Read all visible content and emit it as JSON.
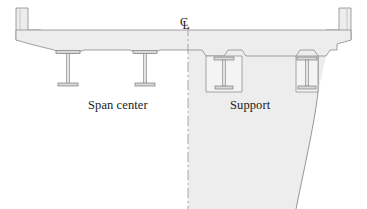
{
  "figure": {
    "type": "engineering-cross-section",
    "labels": {
      "span_center": "Span center",
      "support": "Support",
      "centerline_c": "C",
      "centerline_l": "L"
    },
    "colors": {
      "concrete_fill": "#ededed",
      "concrete_fill_light": "#f2f2f2",
      "outline": "#8a8a8a",
      "outline_dark": "#707070",
      "girder_fill": "#e4e4e4",
      "girder_outline": "#8f8f8f",
      "centerline": "#9a9aa6",
      "text": "#1a1a1a",
      "background": "#ffffff"
    },
    "geometry": {
      "width": 367,
      "height": 209,
      "centerline_x": 188,
      "deck_top_y": 30,
      "deck_soffit_y": 50,
      "parapet_top_y": 8,
      "diaphragm_bottom_y": 209
    },
    "girders": [
      {
        "name": "girder-span-1",
        "x": 68,
        "type": "exposed-i-girder",
        "top_y": 52,
        "bottom_y": 85
      },
      {
        "name": "girder-span-2",
        "x": 145,
        "type": "exposed-i-girder",
        "top_y": 52,
        "bottom_y": 85
      },
      {
        "name": "girder-support-1",
        "x": 224,
        "type": "embedded-i-girder",
        "top_y": 55,
        "bottom_y": 92
      },
      {
        "name": "girder-support-2",
        "x": 307,
        "type": "embedded-i-girder",
        "top_y": 55,
        "bottom_y": 92
      }
    ]
  }
}
